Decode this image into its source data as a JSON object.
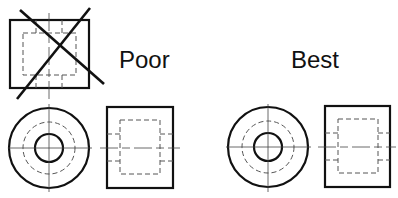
{
  "labels": {
    "poor": "Poor",
    "best": "Best"
  },
  "views": {
    "poor_group": {
      "description": "Incorrect view arrangement: front view placed above the circular view, crossed out",
      "crossed_out": true
    },
    "best_group": {
      "description": "Correct view arrangement: circular view beside the rectangular view"
    }
  },
  "colors": {
    "line": "#111111",
    "hidden_line": "#555555",
    "center_line": "#444444",
    "background": "#ffffff"
  }
}
